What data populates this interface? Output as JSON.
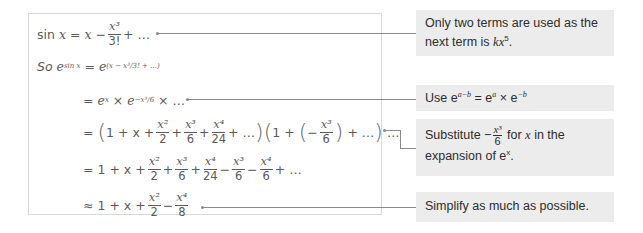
{
  "derivation": {
    "line1": {
      "lhs": "sin",
      "var": "x",
      "eq": "=",
      "t1": "x",
      "minus": "−",
      "frac_num": "x³",
      "frac_den": "3!",
      "tail": "+ …"
    },
    "line2": {
      "prefix": "So",
      "e": "e",
      "exp": "sin x",
      "eq": "=",
      "e2": "e",
      "exp2": "(x − x³/3! + …)"
    },
    "line3": {
      "eq": "=",
      "a": "e",
      "a_exp": "x",
      "times": "×",
      "b": "e",
      "b_exp": "−x³/6",
      "tail": "× …"
    },
    "line4": {
      "eq": "=",
      "open": "(",
      "t": "1 + x +",
      "f1n": "x²",
      "f1d": "2",
      "p1": "+",
      "f2n": "x³",
      "f2d": "6",
      "p2": "+",
      "f3n": "x⁴",
      "f3d": "24",
      "t2": "+ …",
      "close": ")",
      "open2": "(",
      "t3": "1 +",
      "open3": "(",
      "neg": "−",
      "f4n": "x³",
      "f4d": "6",
      "close3": ")",
      "t4": "+ …",
      "close2": ")",
      "tail": "…"
    },
    "line5": {
      "eq": "=",
      "t": "1 + x +",
      "f1n": "x²",
      "f1d": "2",
      "p1": "+",
      "f2n": "x³",
      "f2d": "6",
      "p2": "+",
      "f3n": "x⁴",
      "f3d": "24",
      "m1": "−",
      "f4n": "x³",
      "f4d": "6",
      "m2": "−",
      "f5n": "x⁴",
      "f5d": "6",
      "tail": "+ …"
    },
    "line6": {
      "approx": "≈",
      "t": "1 + x +",
      "f1n": "x²",
      "f1d": "2",
      "m": "−",
      "f2n": "x⁴",
      "f2d": "8"
    }
  },
  "notes": [
    {
      "text": "Only two terms are used as the next term is ",
      "k": "kx",
      "sup": "5",
      "end": "."
    },
    {
      "text": "Use e",
      "sup1": "a−b",
      "mid": " = e",
      "sup2": "a",
      "mid2": " × e",
      "sup3": "−b"
    },
    {
      "pre": "Substitute −",
      "num": "x³",
      "den": "6",
      "mid": " for ",
      "x": "x",
      "post": " in the",
      "line2": "expansion of e",
      "sup": "x",
      "end": "."
    },
    {
      "text": "Simplify as much as possible."
    }
  ],
  "colors": {
    "note_bg": "#ececec",
    "border": "#d9d9d9",
    "math_text": "#5a5a5a",
    "connector": "#8a8a8a"
  }
}
